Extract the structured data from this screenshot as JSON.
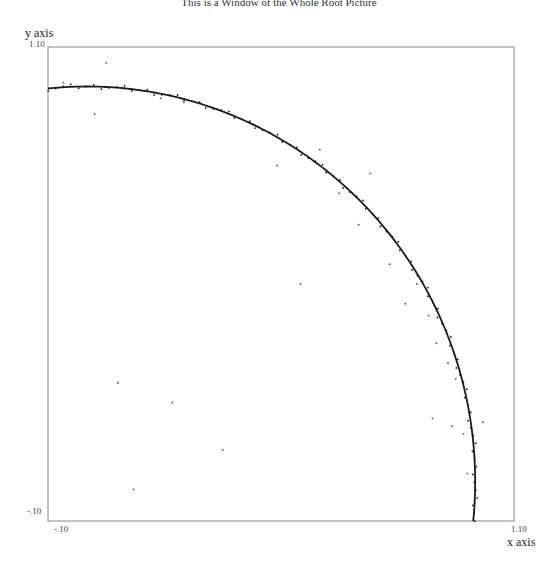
{
  "chart_data": {
    "type": "scatter",
    "title": "This is a Window of the Whole Root Picture",
    "xlabel": "x axis",
    "ylabel": "y axis",
    "xlim": [
      -0.1,
      1.1
    ],
    "ylim": [
      -0.1,
      1.1
    ],
    "x_tick_labels": [
      "-.10",
      "1.10"
    ],
    "y_tick_labels": [
      "1.10",
      "-.10"
    ],
    "grid": false,
    "legend": null,
    "series": [
      {
        "name": "unit circle (roots)",
        "kind": "line",
        "description": "quarter arc of unit circle x^2 + y^2 = 1, from (-0.10, 0.995) to (0.995, -0.10)",
        "radius": 1.0,
        "center": [
          0,
          0
        ]
      },
      {
        "name": "scattered points",
        "kind": "scatter",
        "x": [
          -0.06,
          0.05,
          0.02,
          0.19,
          0.25,
          0.38,
          0.49,
          0.6,
          0.65,
          0.73,
          0.7,
          0.78,
          0.85,
          0.88,
          0.82,
          0.9,
          0.93,
          0.95,
          0.94,
          0.97,
          0.89,
          1.02,
          0.98,
          0.08,
          0.22,
          0.35,
          0.55,
          0.12
        ],
        "y": [
          1.01,
          1.06,
          0.93,
          0.97,
          0.96,
          0.92,
          0.8,
          0.84,
          0.73,
          0.78,
          0.65,
          0.55,
          0.5,
          0.42,
          0.45,
          0.35,
          0.3,
          0.26,
          0.14,
          0.12,
          0.16,
          0.15,
          0.02,
          0.25,
          0.2,
          0.08,
          0.5,
          -0.02
        ]
      }
    ]
  },
  "axes": {
    "y_label": "y axis",
    "y_top": "1.10",
    "y_bottom": "-.10",
    "x_left": "-.10",
    "x_right": "1.10",
    "x_label": "x axis"
  },
  "colors": {
    "curve": "#1a1a1a",
    "points": "#555555",
    "frame": "#888888"
  }
}
